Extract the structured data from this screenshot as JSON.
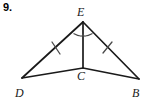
{
  "problem": {
    "number": "9."
  },
  "figure": {
    "type": "geometry-diagram",
    "stroke_color": "#1a1a1a",
    "mark_color": "#4a4a4a",
    "background_color": "#ffffff",
    "vertices": [
      {
        "id": "E",
        "label": "E",
        "x": 83,
        "y": 22,
        "label_x": 77,
        "label_y": 16
      },
      {
        "id": "C",
        "label": "C",
        "x": 83,
        "y": 68,
        "label_x": 77,
        "label_y": 80
      },
      {
        "id": "D",
        "label": "D",
        "x": 22,
        "y": 78,
        "label_x": 15,
        "label_y": 97
      },
      {
        "id": "B",
        "label": "B",
        "x": 139,
        "y": 79,
        "label_x": 132,
        "label_y": 97
      }
    ],
    "segments": [
      {
        "id": "DE",
        "from": "D",
        "to": "E"
      },
      {
        "id": "EB",
        "from": "E",
        "to": "B"
      },
      {
        "id": "EC",
        "from": "E",
        "to": "C"
      },
      {
        "id": "DC",
        "from": "D",
        "to": "C"
      },
      {
        "id": "CB",
        "from": "C",
        "to": "B"
      }
    ],
    "tick_marks": [
      {
        "id": "tick-DE",
        "on_segment": "DE",
        "count": 1
      },
      {
        "id": "tick-EB",
        "on_segment": "EB",
        "count": 1
      }
    ],
    "angle_arcs": [
      {
        "id": "arc-DEC",
        "at_vertex": "E",
        "between": "DE and EC"
      },
      {
        "id": "arc-CEB",
        "at_vertex": "E",
        "between": "EC and EB"
      }
    ]
  }
}
